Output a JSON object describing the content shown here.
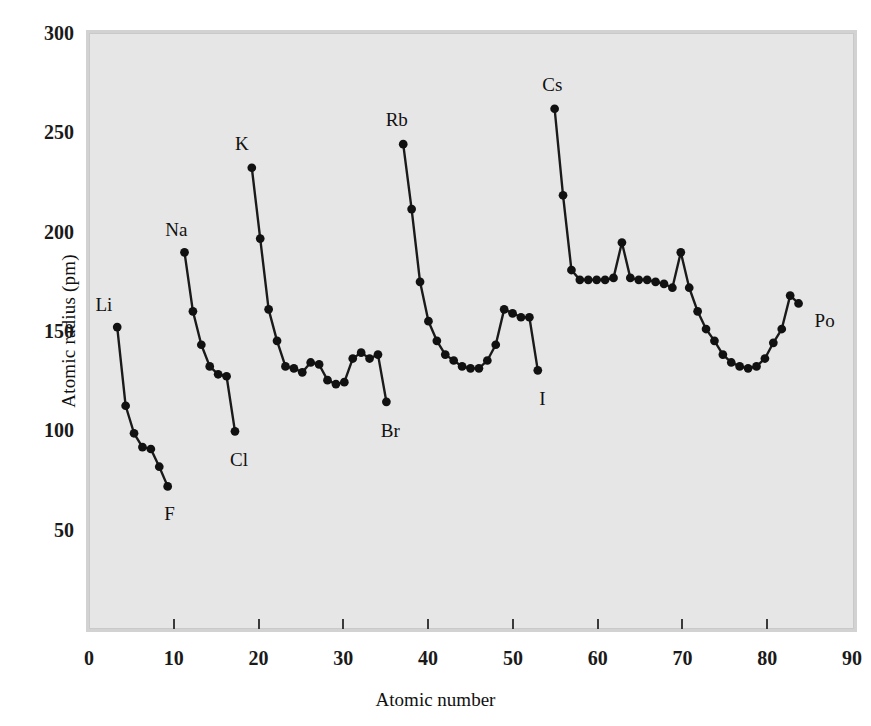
{
  "figure": {
    "xlabel": "Atomic number",
    "ylabel": "Atomic radius (pm)"
  },
  "axes": {
    "y_ticks": [
      {
        "value": 300,
        "label": "300"
      },
      {
        "value": 250,
        "label": "250"
      },
      {
        "value": 200,
        "label": "200"
      },
      {
        "value": 150,
        "label": "150"
      },
      {
        "value": 100,
        "label": "100"
      },
      {
        "value": 50,
        "label": "50"
      }
    ],
    "x_ticks": [
      {
        "value": 0,
        "label": "0"
      },
      {
        "value": 10,
        "label": "10"
      },
      {
        "value": 20,
        "label": "20"
      },
      {
        "value": 30,
        "label": "30"
      },
      {
        "value": 40,
        "label": "40"
      },
      {
        "value": 50,
        "label": "50"
      },
      {
        "value": 60,
        "label": "60"
      },
      {
        "value": 70,
        "label": "70"
      },
      {
        "value": 80,
        "label": "80"
      },
      {
        "value": 90,
        "label": "90"
      }
    ]
  },
  "style": {
    "plot_background": "#e6e6e6",
    "frame_color": "#d2d2d2",
    "line_color": "#1a1a1a",
    "marker_color": "#111111",
    "text_color": "#111111"
  },
  "annotations": [
    {
      "text": "Li",
      "x": 3,
      "y": 152,
      "dx": -22,
      "dy": -26
    },
    {
      "text": "F",
      "x": 9,
      "y": 71,
      "dx": -4,
      "dy": 22
    },
    {
      "text": "Na",
      "x": 11,
      "y": 190,
      "dx": -20,
      "dy": -26
    },
    {
      "text": "Cl",
      "x": 17,
      "y": 99,
      "dx": -6,
      "dy": 24
    },
    {
      "text": "K",
      "x": 19,
      "y": 233,
      "dx": -18,
      "dy": -26
    },
    {
      "text": "Br",
      "x": 35,
      "y": 114,
      "dx": -8,
      "dy": 24
    },
    {
      "text": "Rb",
      "x": 37,
      "y": 245,
      "dx": -20,
      "dy": -26
    },
    {
      "text": "I",
      "x": 53,
      "y": 130,
      "dx": -2,
      "dy": 24
    },
    {
      "text": "Cs",
      "x": 55,
      "y": 263,
      "dx": -16,
      "dy": -26
    },
    {
      "text": "Po",
      "x": 85,
      "y": 166,
      "dx": 2,
      "dy": 18
    }
  ],
  "chart_data": {
    "type": "line",
    "title": "",
    "xlabel": "Atomic number",
    "ylabel": "Atomic radius (pm)",
    "xlim": [
      0,
      90
    ],
    "ylim": [
      0,
      300
    ],
    "grid": false,
    "legend": "none",
    "marker": "filled-circle",
    "series": [
      {
        "name": "Period 2 (Li-F)",
        "x": [
          3,
          4,
          5,
          6,
          7,
          8,
          9
        ],
        "y": [
          152,
          112,
          98,
          91,
          90,
          81,
          71
        ]
      },
      {
        "name": "Period 3 (Na-Cl)",
        "x": [
          11,
          12,
          13,
          14,
          15,
          16,
          17
        ],
        "y": [
          190,
          160,
          143,
          132,
          128,
          127,
          99
        ]
      },
      {
        "name": "Period 4 (K-Br)",
        "x": [
          19,
          20,
          21,
          22,
          23,
          24,
          25,
          26,
          27,
          28,
          29,
          30,
          31,
          32,
          33,
          34,
          35
        ],
        "y": [
          233,
          197,
          161,
          145,
          132,
          131,
          129,
          134,
          133,
          125,
          123,
          124,
          136,
          139,
          136,
          138,
          114
        ]
      },
      {
        "name": "Period 5 (Rb-I)",
        "x": [
          37,
          38,
          39,
          40,
          41,
          42,
          43,
          44,
          45,
          46,
          47,
          48,
          49,
          50,
          51,
          52,
          53
        ],
        "y": [
          245,
          212,
          175,
          155,
          145,
          138,
          135,
          132,
          131,
          131,
          135,
          143,
          161,
          159,
          157,
          157,
          130
        ]
      },
      {
        "name": "Period 6 (Cs-Po)",
        "x": [
          55,
          56,
          57,
          58,
          59,
          60,
          61,
          62,
          63,
          64,
          65,
          66,
          67,
          68,
          69,
          70,
          71,
          72,
          73,
          74,
          75,
          76,
          77,
          78,
          79,
          80,
          81,
          82,
          83,
          84
        ],
        "y": [
          263,
          219,
          181,
          176,
          176,
          176,
          176,
          177,
          195,
          177,
          176,
          176,
          175,
          174,
          172,
          190,
          172,
          160,
          151,
          145,
          138,
          134,
          132,
          131,
          132,
          136,
          144,
          151,
          168,
          164
        ]
      }
    ]
  },
  "ghost_text": [
    {
      "text": "the atomic radius of an element is",
      "x": 120,
      "y": 88
    },
    {
      "text": "the distance between nuclei in",
      "x": 120,
      "y": 112
    },
    {
      "text": "a metallic solid, or half the",
      "x": 120,
      "y": 136
    },
    {
      "text": "distance between nuclei in a",
      "x": 120,
      "y": 160
    },
    {
      "text": "covalently bonded molecule",
      "x": 120,
      "y": 196
    },
    {
      "text": "periodic trends across rows",
      "x": 120,
      "y": 220
    },
    {
      "text": "radii decrease left to right",
      "x": 120,
      "y": 430
    },
    {
      "text": "and increase down a group",
      "x": 120,
      "y": 454
    },
    {
      "text": "2.2 Atomic Radius",
      "x": 120,
      "y": 512
    },
    {
      "text": "shielding effects and effective nuclear charge",
      "x": 120,
      "y": 536
    },
    {
      "text": "explain the observed contraction across a period",
      "x": 120,
      "y": 560
    },
    {
      "text": "while added shells dominate down a group",
      "x": 120,
      "y": 584
    }
  ]
}
